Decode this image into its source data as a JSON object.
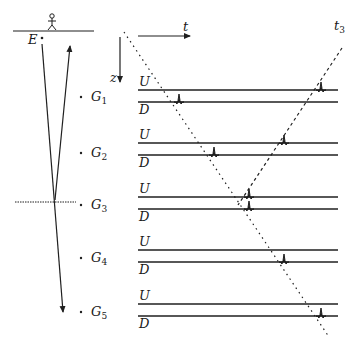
{
  "figure": {
    "type": "seismic reflection diagram",
    "axes": {
      "time_label": "t",
      "depth_label": "z"
    },
    "source_label": "E",
    "arrival_time_label": "t",
    "arrival_time_sub": "3",
    "receivers": [
      {
        "name": "G",
        "sub": "1",
        "up_label": "U",
        "down_label": "D"
      },
      {
        "name": "G",
        "sub": "2",
        "up_label": "U",
        "down_label": "D"
      },
      {
        "name": "G",
        "sub": "3",
        "up_label": "U",
        "down_label": "D"
      },
      {
        "name": "G",
        "sub": "4",
        "up_label": "U",
        "down_label": "D"
      },
      {
        "name": "G",
        "sub": "5",
        "up_label": "U",
        "down_label": "D"
      }
    ],
    "colors": {
      "ink": "#1f1f1f",
      "background": "#ffffff"
    }
  }
}
